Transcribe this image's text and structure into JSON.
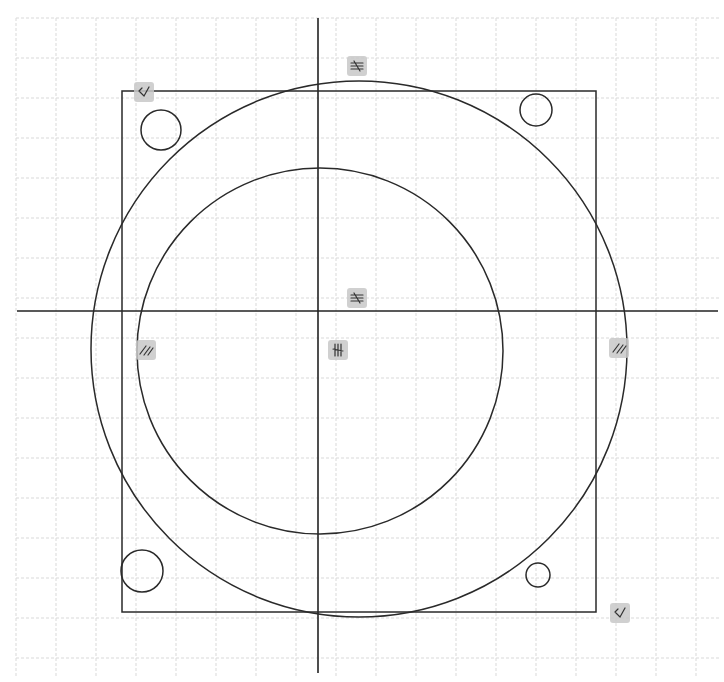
{
  "sketch": {
    "title": "CAD sketch - square plate with concentric circles and corner holes",
    "canvas": {
      "width": 724,
      "height": 682,
      "background": "#ffffff"
    },
    "grid": {
      "origin_x": 16,
      "origin_y": 18,
      "spacing": 40,
      "color": "#d9d9d9"
    },
    "axes": {
      "vertical": {
        "x": 318,
        "y1": 18,
        "y2": 673
      },
      "horizontal": {
        "y": 311,
        "x1": 17,
        "x2": 718
      }
    },
    "rectangle": {
      "x": 122,
      "y": 91,
      "width": 474,
      "height": 521
    },
    "circles": [
      {
        "name": "outer-circle",
        "cx": 359,
        "cy": 349,
        "r": 268
      },
      {
        "name": "inner-circle",
        "cx": 320,
        "cy": 351,
        "r": 183
      },
      {
        "name": "hole-top-left",
        "cx": 161,
        "cy": 130,
        "r": 20
      },
      {
        "name": "hole-top-right",
        "cx": 536,
        "cy": 110,
        "r": 16
      },
      {
        "name": "hole-bottom-left",
        "cx": 142,
        "cy": 571,
        "r": 21
      },
      {
        "name": "hole-bottom-right",
        "cx": 538,
        "cy": 575,
        "r": 12
      }
    ],
    "constraints": [
      {
        "type": "perpendicular",
        "glyph": "⊥",
        "x": 144,
        "y": 92,
        "label": "perpendicular-constraint-top-left"
      },
      {
        "type": "perpendicular",
        "glyph": "⊥",
        "x": 620,
        "y": 613,
        "label": "perpendicular-constraint-bottom-right"
      },
      {
        "type": "horizontal-equal",
        "glyph": "≡",
        "x": 357,
        "y": 66,
        "label": "equal-constraint-top"
      },
      {
        "type": "horizontal-equal",
        "glyph": "≡",
        "x": 357,
        "y": 298,
        "label": "equal-constraint-center"
      },
      {
        "type": "vertical-equal",
        "glyph": "≡",
        "x": 338,
        "y": 350,
        "label": "equal-constraint-vertical"
      },
      {
        "type": "parallel",
        "glyph": "//",
        "x": 146,
        "y": 350,
        "label": "parallel-constraint-left"
      },
      {
        "type": "parallel",
        "glyph": "//",
        "x": 619,
        "y": 348,
        "label": "parallel-constraint-right"
      }
    ]
  }
}
